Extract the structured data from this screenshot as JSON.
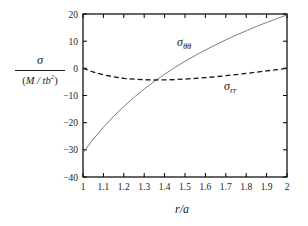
{
  "figure": {
    "background": "#ffffff",
    "axis_color": "#000000",
    "tick_label_color": "#1a1a1a"
  },
  "labels": {
    "y_axis_fraction": {
      "numerator": "σ",
      "den_open": "(",
      "den_main": "M / tb",
      "den_exponent": "2",
      "den_close": ")"
    },
    "x_axis": "r/a",
    "curve_theta": {
      "base": "σ",
      "subscript": "θθ"
    },
    "curve_r": {
      "base": "σ",
      "subscript": "rr"
    }
  },
  "chart_data": {
    "type": "line",
    "xlabel": "r/a",
    "ylabel": "σ/(M/tb²)",
    "xlim": [
      1,
      2
    ],
    "ylim": [
      -40,
      20
    ],
    "grid": false,
    "legend": "inline annotations on curves",
    "xticks": [
      1,
      1.1,
      1.2,
      1.3,
      1.4,
      1.5,
      1.6,
      1.7,
      1.8,
      1.9,
      2
    ],
    "xtick_labels": [
      "1",
      "1.1",
      "1.2",
      "1.3",
      "1.4",
      "1.5",
      "1.6",
      "1.7",
      "1.8",
      "1.9",
      "2"
    ],
    "yticks": [
      -40,
      -30,
      -20,
      -10,
      0,
      10,
      20
    ],
    "ytick_labels": [
      "−40",
      "−30",
      "−20",
      "−10",
      "0",
      "10",
      "20"
    ],
    "x": [
      1,
      1.05,
      1.1,
      1.15,
      1.2,
      1.25,
      1.3,
      1.35,
      1.4,
      1.45,
      1.5,
      1.55,
      1.6,
      1.65,
      1.7,
      1.75,
      1.8,
      1.85,
      1.9,
      1.95,
      2
    ],
    "series": [
      {
        "name": "sigma_theta_theta",
        "label": "σθθ",
        "style": "solid",
        "color": "#6e6e6e",
        "width": 0.9,
        "values": [
          -31.02,
          -26.1,
          -21.67,
          -17.67,
          -14.03,
          -10.7,
          -7.63,
          -4.8,
          -2.17,
          0.29,
          2.58,
          4.73,
          6.76,
          8.67,
          10.48,
          12.2,
          13.83,
          15.39,
          16.88,
          18.3,
          19.67
        ]
      },
      {
        "name": "sigma_rr",
        "label": "σrr",
        "style": "dashed",
        "dash": "5,3",
        "color": "#161616",
        "width": 1.3,
        "values": [
          0,
          -1.36,
          -2.38,
          -3.13,
          -3.66,
          -4.01,
          -4.2,
          -4.28,
          -4.25,
          -4.13,
          -3.95,
          -3.7,
          -3.41,
          -3.07,
          -2.7,
          -2.3,
          -1.87,
          -1.43,
          -0.96,
          -0.49,
          0
        ]
      }
    ]
  }
}
